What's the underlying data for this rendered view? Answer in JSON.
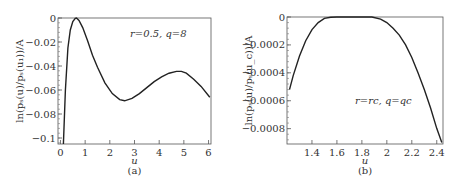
{
  "chart_data": [
    {
      "type": "line",
      "panel_label": "(a)",
      "xlabel": "u",
      "ylabel": "ln(p_s(u)/p_s(u_1))/A",
      "annotation": "r=0.5,  q=8",
      "xlim": [
        -0.1,
        6.1
      ],
      "ylim": [
        -0.105,
        0
      ],
      "xticks": [
        "0",
        "1",
        "2",
        "3",
        "4",
        "5",
        "6"
      ],
      "yticks": [
        "0",
        "-0.02",
        "-0.04",
        "-0.06",
        "-0.08",
        "-0.1"
      ],
      "grid": false,
      "x": [
        0.12,
        0.2,
        0.3,
        0.4,
        0.5,
        0.6,
        0.65,
        0.75,
        0.9,
        1.1,
        1.3,
        1.5,
        1.8,
        2.1,
        2.4,
        2.6,
        2.9,
        3.2,
        3.5,
        3.8,
        4.1,
        4.4,
        4.7,
        4.9,
        5.1,
        5.4,
        5.7,
        6.05
      ],
      "y": [
        -0.105,
        -0.06,
        -0.025,
        -0.01,
        -0.003,
        -0.0003,
        0,
        -0.002,
        -0.008,
        -0.019,
        -0.031,
        -0.041,
        -0.054,
        -0.063,
        -0.068,
        -0.069,
        -0.067,
        -0.063,
        -0.058,
        -0.053,
        -0.049,
        -0.046,
        -0.0445,
        -0.0445,
        -0.046,
        -0.051,
        -0.057,
        -0.066
      ]
    },
    {
      "type": "line",
      "panel_label": "(b)",
      "xlabel": "u",
      "ylabel": "ln(p_s(u)/p_s(u_c))/A",
      "annotation": "r=r_c,  q=q_c",
      "xlim": [
        1.2,
        2.45
      ],
      "ylim": [
        -0.00091,
        0
      ],
      "xticks": [
        "1.4",
        "1.6",
        "1.8",
        "2",
        "2.2",
        "2.4"
      ],
      "yticks": [
        "0",
        "-0.0002",
        "-0.0004",
        "-0.0006",
        "-0.0008"
      ],
      "grid": false,
      "x": [
        1.22,
        1.25,
        1.3,
        1.35,
        1.4,
        1.45,
        1.5,
        1.55,
        1.6,
        1.7,
        1.8,
        1.88,
        1.95,
        2.0,
        2.05,
        2.1,
        2.15,
        2.2,
        2.25,
        2.3,
        2.35,
        2.4,
        2.44
      ],
      "y": [
        -0.00052,
        -0.00042,
        -0.00028,
        -0.00017,
        -9e-05,
        -4e-05,
        -1e-05,
        -2e-06,
        0,
        0,
        0,
        0,
        -1.5e-05,
        -4e-05,
        -8e-05,
        -0.00013,
        -0.0002,
        -0.00029,
        -0.0004,
        -0.00052,
        -0.00065,
        -0.0008,
        -0.0009
      ]
    }
  ]
}
